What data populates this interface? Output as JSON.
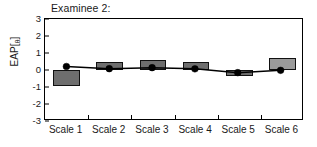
{
  "chart_data": {
    "type": "bar",
    "title": "Examinee 2:",
    "xlabel": "",
    "ylabel": "EAP[θ]",
    "ylabel_main": "EAP[",
    "ylabel_sub": "θ",
    "ylabel_close": "]",
    "categories": [
      "Scale 1",
      "Scale 2",
      "Scale 3",
      "Scale 4",
      "Scale 5",
      "Scale 6"
    ],
    "ylim": [
      -3,
      3
    ],
    "yticks": [
      3,
      2,
      1,
      0,
      -1,
      -2,
      -3
    ],
    "ytick_labels": [
      "3",
      "2",
      "1",
      "0",
      "-1",
      "-2",
      "-3"
    ],
    "grid": false,
    "legend": "none",
    "series": [
      {
        "name": "EAP bar estimate",
        "kind": "bar",
        "values": [
          -0.95,
          0.5,
          0.6,
          0.48,
          -0.38,
          0.72
        ],
        "colors": [
          "#6e6e6e",
          "#6e6e6e",
          "#6e6e6e",
          "#6e6e6e",
          "#6e6e6e",
          "#9a9a9a"
        ]
      },
      {
        "name": "Overall EAP profile line",
        "kind": "line",
        "values": [
          0.15,
          0.02,
          0.08,
          0.01,
          -0.22,
          -0.08
        ],
        "marker": "circle",
        "color": "#000000"
      }
    ]
  },
  "figure": {
    "background": "#ffffff",
    "frame_color": "#000000",
    "bar_edge_color": "#111111",
    "bar_fill": "#6e6e6e",
    "bar_fill_light": "#9a9a9a",
    "line_color": "#000000"
  }
}
